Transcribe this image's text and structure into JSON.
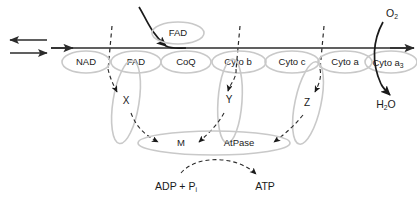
{
  "diagram": {
    "colors": {
      "background": "#ffffff",
      "ellipse_stroke": "#c9c9c9",
      "line_stroke": "#2b2b2b",
      "text": "#1a1a1a"
    },
    "carriers": [
      {
        "id": "nad",
        "label": "NAD",
        "cx": 86,
        "cy": 62,
        "rx": 24,
        "ry": 11
      },
      {
        "id": "fad-chain",
        "label": "FAD",
        "cx": 136,
        "cy": 62,
        "rx": 25,
        "ry": 11
      },
      {
        "id": "coq",
        "label": "CoQ",
        "cx": 186,
        "cy": 62,
        "rx": 25,
        "ry": 11
      },
      {
        "id": "cyto-b",
        "label": "Cyto b",
        "cx": 239,
        "cy": 62,
        "rx": 27,
        "ry": 11
      },
      {
        "id": "cyto-c",
        "label": "Cyto c",
        "cx": 292,
        "cy": 62,
        "rx": 27,
        "ry": 11
      },
      {
        "id": "cyto-a",
        "label": "Cyto a",
        "cx": 345,
        "cy": 62,
        "rx": 27,
        "ry": 11
      }
    ],
    "cyto_a3": {
      "id": "cyto-a3",
      "label_main": "Cyto a",
      "label_sub": "3",
      "cx": 391,
      "cy": 62,
      "rx": 26,
      "ry": 11
    },
    "fad_top": {
      "id": "fad-top",
      "label": "FAD",
      "cx": 178,
      "cy": 33,
      "rx": 26,
      "ry": 11
    },
    "intermediates": [
      {
        "id": "x",
        "label": "X",
        "x": 126,
        "y": 101
      },
      {
        "id": "y",
        "label": "Y",
        "x": 229,
        "y": 100
      },
      {
        "id": "z",
        "label": "Z",
        "x": 307,
        "y": 103
      }
    ],
    "complex": {
      "id": "m-atpase",
      "cx": 214,
      "cy": 143,
      "rx": 76,
      "ry": 12,
      "labels": [
        {
          "id": "m",
          "label": "M",
          "x": 181,
          "y": 143
        },
        {
          "id": "atpase",
          "label": "AtPase",
          "x": 239,
          "y": 143
        }
      ]
    },
    "terminals": {
      "oxygen": {
        "label_main": "O",
        "label_sub": "2",
        "x": 390,
        "y": 14
      },
      "water": {
        "label_main": "H",
        "label_sub": "2",
        "label_tail": "O",
        "x": 387,
        "y": 104
      }
    },
    "substrates": {
      "adp": {
        "label_main": "ADP + P",
        "label_sub": "i",
        "x": 176,
        "y": 186
      },
      "atp": {
        "label": "ATP",
        "x": 265,
        "y": 186
      }
    },
    "reversible_arrows": {
      "top_direction": "left",
      "bottom_direction": "right"
    },
    "dashed_dividers": [
      110,
      238,
      322
    ]
  }
}
